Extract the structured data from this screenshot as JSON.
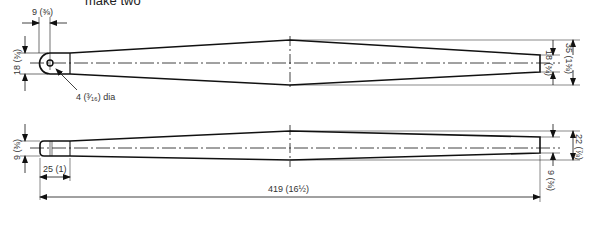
{
  "title": "make two",
  "top_view": {
    "dims": {
      "end_radius_offset": "9 (⅜)",
      "end_width": "18 (¾)",
      "hole": "4 (³⁄₁₆) dia",
      "tip_width": "18 (¾)",
      "max_width": "35 (1⅜)"
    }
  },
  "side_view": {
    "dims": {
      "end_thickness": "9 (⅜)",
      "tenon_length": "25 (1)",
      "overall_length": "419 (16½)",
      "max_thickness": "22 (⅞)",
      "tip_thickness": "9 (⅜)"
    }
  }
}
